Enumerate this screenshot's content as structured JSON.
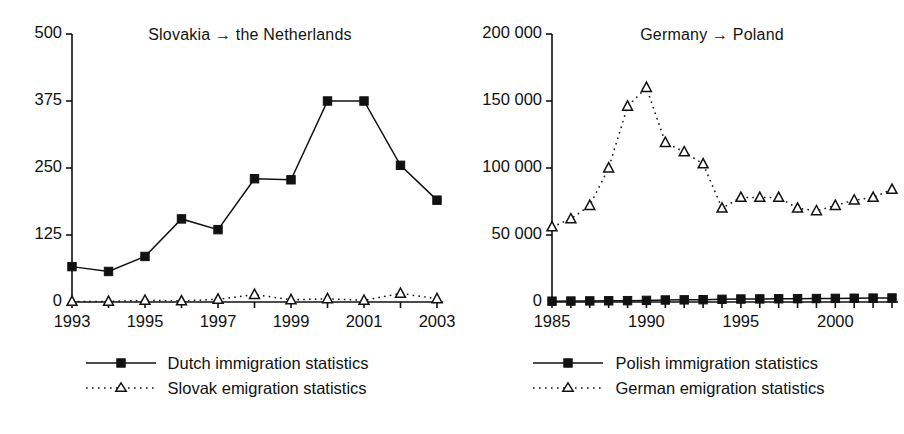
{
  "figure": {
    "background": "#ffffff",
    "ink_color": "#111111"
  },
  "panels": [
    {
      "id": "slovakia-netherlands",
      "title": "Slovakia → the Netherlands",
      "legend": [
        {
          "label": "Dutch immigration statistics",
          "marker": "square-marker",
          "line": "solid"
        },
        {
          "label": "Slovak emigration statistics",
          "marker": "triangle-marker",
          "line": "dotted"
        }
      ]
    },
    {
      "id": "germany-poland",
      "title": "Germany → Poland",
      "legend": [
        {
          "label": "Polish immigration statistics",
          "marker": "square-marker",
          "line": "solid"
        },
        {
          "label": "German emigration statistics",
          "marker": "triangle-marker",
          "line": "dotted"
        }
      ]
    }
  ],
  "chart_data": [
    {
      "type": "line",
      "title": "Slovakia → the Netherlands",
      "xlabel": "",
      "ylabel": "",
      "x": [
        1993,
        1994,
        1995,
        1996,
        1997,
        1998,
        1999,
        2000,
        2001,
        2002,
        2003
      ],
      "xlim": [
        1993,
        2003
      ],
      "ylim": [
        0,
        500
      ],
      "yticks": [
        0,
        125,
        250,
        375,
        500
      ],
      "ytick_labels": [
        "0",
        "125",
        "250",
        "375",
        "500"
      ],
      "xticks": [
        1993,
        1994,
        1995,
        1996,
        1997,
        1998,
        1999,
        2000,
        2001,
        2002,
        2003
      ],
      "xtick_labels": [
        "1993",
        "",
        "1995",
        "",
        "1997",
        "",
        "1999",
        "",
        "2001",
        "",
        "2003"
      ],
      "grid": false,
      "legend_position": "below",
      "series": [
        {
          "name": "Dutch immigration statistics",
          "marker": "square-marker",
          "line": "solid",
          "values": [
            66,
            57,
            85,
            155,
            135,
            230,
            228,
            375,
            375,
            255,
            190
          ]
        },
        {
          "name": "Slovak emigration statistics",
          "marker": "triangle-marker",
          "line": "dotted",
          "values": [
            1,
            1,
            3,
            2,
            5,
            14,
            4,
            6,
            3,
            16,
            6
          ]
        }
      ]
    },
    {
      "type": "line",
      "title": "Germany → Poland",
      "xlabel": "",
      "ylabel": "",
      "x": [
        1985,
        1986,
        1987,
        1988,
        1989,
        1990,
        1991,
        1992,
        1993,
        1994,
        1995,
        1996,
        1997,
        1998,
        1999,
        2000,
        2001,
        2002,
        2003
      ],
      "xlim": [
        1985,
        2003
      ],
      "ylim": [
        0,
        200000
      ],
      "yticks": [
        0,
        50000,
        100000,
        150000,
        200000
      ],
      "ytick_labels": [
        "0",
        "50 000",
        "100 000",
        "150 000",
        "200 000"
      ],
      "xticks": [
        1985,
        1986,
        1987,
        1988,
        1989,
        1990,
        1991,
        1992,
        1993,
        1994,
        1995,
        1996,
        1997,
        1998,
        1999,
        2000,
        2001,
        2002,
        2003
      ],
      "xtick_labels": [
        "1985",
        "",
        "",
        "",
        "",
        "1990",
        "",
        "",
        "",
        "",
        "1995",
        "",
        "",
        "",
        "",
        "2000",
        "",
        "",
        ""
      ],
      "grid": false,
      "legend_position": "below",
      "series": [
        {
          "name": "Polish immigration statistics",
          "marker": "square-marker",
          "line": "solid",
          "values": [
            600,
            700,
            800,
            900,
            1000,
            1200,
            1500,
            1600,
            1700,
            2000,
            2200,
            2300,
            2400,
            2500,
            2600,
            2700,
            2800,
            2900,
            3000
          ]
        },
        {
          "name": "German emigration statistics",
          "marker": "triangle-marker",
          "line": "dotted",
          "values": [
            56000,
            62000,
            72000,
            100000,
            146000,
            160000,
            119000,
            112000,
            103000,
            70000,
            78000,
            78000,
            78000,
            70000,
            68000,
            72000,
            76000,
            78000,
            84000
          ]
        }
      ]
    }
  ]
}
